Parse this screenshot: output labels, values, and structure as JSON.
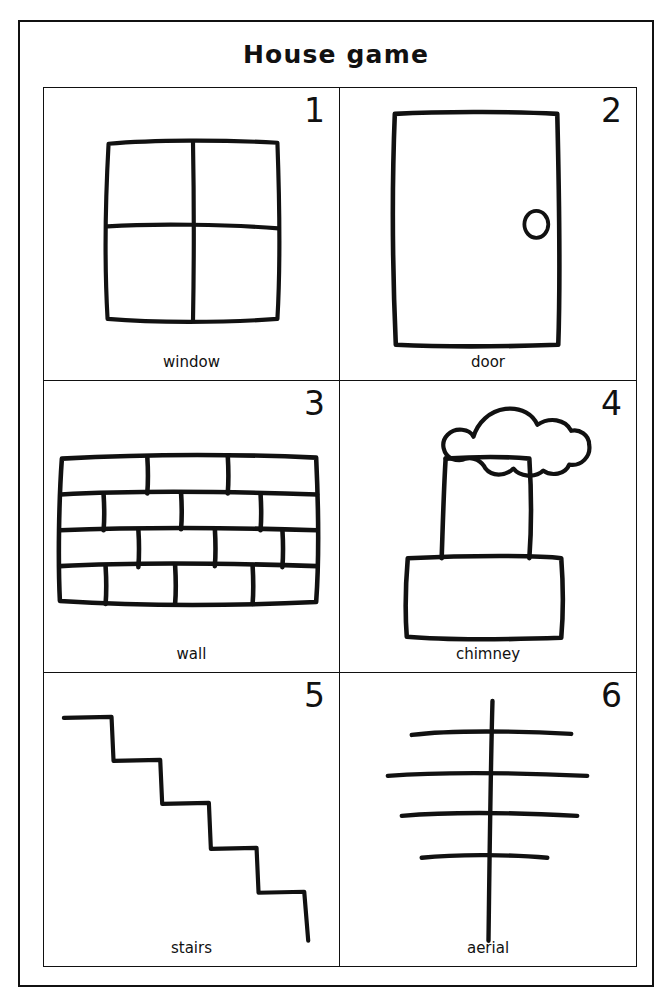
{
  "page": {
    "title": "House game",
    "background_color": "#ffffff",
    "ink_color": "#111111"
  },
  "grid": {
    "columns": 2,
    "rows": 3,
    "cards": [
      {
        "number": "1",
        "label": "window",
        "icon": "window-icon",
        "description": "Hand-drawn square window divided into four panes by a cross"
      },
      {
        "number": "2",
        "label": "door",
        "icon": "door-icon",
        "description": "Hand-drawn tall rectangular door with a round knob on the right"
      },
      {
        "number": "3",
        "label": "wall",
        "icon": "wall-icon",
        "description": "Hand-drawn brick wall of four staggered rows of bricks"
      },
      {
        "number": "4",
        "label": "chimney",
        "icon": "chimney-icon",
        "description": "Hand-drawn chimney with a wide base, tall stack and puff of smoke"
      },
      {
        "number": "5",
        "label": "stairs",
        "icon": "stairs-icon",
        "description": "Hand-drawn staircase of five steps descending to the right"
      },
      {
        "number": "6",
        "label": "aerial",
        "icon": "aerial-icon",
        "description": "Hand-drawn television aerial: vertical mast with four crossbars"
      }
    ]
  }
}
